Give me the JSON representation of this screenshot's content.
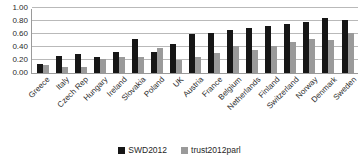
{
  "chart_data": {
    "type": "bar",
    "title": "",
    "subtitle": "",
    "xlabel": "",
    "ylabel": "",
    "ylim": [
      0.0,
      1.0
    ],
    "ytick_step": 0.2,
    "ytick_labels": [
      "1.00",
      "0.80",
      "0.60",
      "0.40",
      "0.20",
      "0.00"
    ],
    "ytick_values": [
      1.0,
      0.8,
      0.6,
      0.4,
      0.2,
      0.0
    ],
    "grid": true,
    "grid_axis": "y",
    "legend_position": "bottom-center",
    "categories": [
      "Greece",
      "Italy",
      "Czech Rep",
      "Hungary",
      "Ireland",
      "Slovakia",
      "Poland",
      "UK",
      "Austria",
      "France",
      "Belgium",
      "Netherlands",
      "Finland",
      "Switzerland",
      "Norway",
      "Denmark",
      "Sweden"
    ],
    "series": [
      {
        "name": "SWD2012",
        "color": "#161616",
        "values": [
          0.14,
          0.26,
          0.3,
          0.25,
          0.33,
          0.52,
          0.32,
          0.45,
          0.6,
          0.62,
          0.66,
          0.7,
          0.72,
          0.76,
          0.78,
          0.84,
          0.82
        ]
      },
      {
        "name": "trust2012parl",
        "color": "#9a9a9a",
        "values": [
          0.12,
          0.09,
          0.1,
          0.22,
          0.25,
          0.25,
          0.39,
          0.2,
          0.25,
          0.31,
          0.42,
          0.36,
          0.41,
          0.48,
          0.53,
          0.51,
          0.62
        ]
      }
    ]
  },
  "legend": {
    "items": [
      {
        "label": "SWD2012",
        "swatch": "legend-swatch-black"
      },
      {
        "label": "trust2012parl",
        "swatch": "legend-swatch-gray"
      }
    ]
  }
}
